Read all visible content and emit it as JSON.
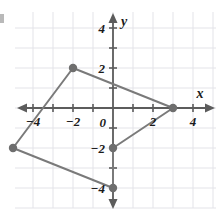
{
  "figure": {
    "type": "coordinate-plane-polygon",
    "background": "#ffffff",
    "grid_color": "#e3e3e8",
    "axis_color": "#5c5c5c",
    "shape_color": "#7a7a7a",
    "vertex_color": "#6e6e6e",
    "label_color": "#1a1a1a"
  },
  "axes": {
    "x_label": "x",
    "y_label": "y",
    "origin_label": "0",
    "x_ticks": [
      {
        "value": -4,
        "label": "−4"
      },
      {
        "value": -3,
        "label": ""
      },
      {
        "value": -2,
        "label": "−2"
      },
      {
        "value": -1,
        "label": ""
      },
      {
        "value": 1,
        "label": ""
      },
      {
        "value": 2,
        "label": "2"
      },
      {
        "value": 3,
        "label": ""
      },
      {
        "value": 4,
        "label": "4"
      }
    ],
    "y_ticks": [
      {
        "value": 4,
        "label": "4"
      },
      {
        "value": 3,
        "label": ""
      },
      {
        "value": 2,
        "label": "2"
      },
      {
        "value": 1,
        "label": ""
      },
      {
        "value": -1,
        "label": ""
      },
      {
        "value": -2,
        "label": "−2"
      },
      {
        "value": -3,
        "label": ""
      },
      {
        "value": -4,
        "label": "−4"
      }
    ],
    "xlim": [
      -5.7,
      5.2
    ],
    "ylim": [
      -5.1,
      5.0
    ],
    "grid": true,
    "grid_step": 1
  },
  "chart_data": {
    "type": "scatter",
    "title": "",
    "xlabel": "x",
    "ylabel": "y",
    "xlim": [
      -5.7,
      5.2
    ],
    "ylim": [
      -5.1,
      5.0
    ],
    "grid": true,
    "legend": "none",
    "series": [
      {
        "name": "polygon",
        "closed": true,
        "points": [
          {
            "x": -2,
            "y": 2
          },
          {
            "x": 3,
            "y": 0
          },
          {
            "x": 0,
            "y": -2
          },
          {
            "x": 0,
            "y": -4
          },
          {
            "x": -5,
            "y": -2
          }
        ]
      }
    ]
  }
}
